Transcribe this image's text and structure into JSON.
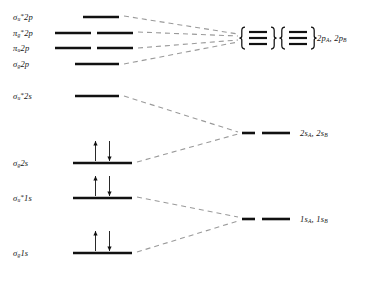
{
  "chart_data": {
    "type": "diagram",
    "xlabel": "",
    "ylabel": "",
    "grid": false,
    "legend": false,
    "mo_levels": [
      {
        "id": "sigma-u-star-2p",
        "label_parts": {
          "symbol": "σ",
          "sub": "u",
          "star": "*",
          "shell": "2p"
        },
        "label_text": "σu*2p",
        "y": 17,
        "degeneracy": 1,
        "electrons": 0,
        "segments": [
          {
            "x1": 83,
            "x2": 119
          }
        ]
      },
      {
        "id": "pi-g-star-2p",
        "label_parts": {
          "symbol": "π",
          "sub": "g",
          "star": "*",
          "shell": "2p"
        },
        "label_text": "πg*2p",
        "y": 33,
        "degeneracy": 2,
        "electrons": 0,
        "segments": [
          {
            "x1": 55,
            "x2": 91
          },
          {
            "x1": 97,
            "x2": 133
          }
        ]
      },
      {
        "id": "pi-u-2p",
        "label_parts": {
          "symbol": "π",
          "sub": "u",
          "star": "",
          "shell": "2p"
        },
        "label_text": "πu2p",
        "y": 48,
        "degeneracy": 2,
        "electrons": 0,
        "segments": [
          {
            "x1": 55,
            "x2": 91
          },
          {
            "x1": 97,
            "x2": 133
          }
        ]
      },
      {
        "id": "sigma-g-2p",
        "label_parts": {
          "symbol": "σ",
          "sub": "g",
          "star": "",
          "shell": "2p"
        },
        "label_text": "σg2p",
        "y": 64,
        "degeneracy": 1,
        "electrons": 0,
        "segments": [
          {
            "x1": 75,
            "x2": 119
          }
        ]
      },
      {
        "id": "sigma-u-star-2s",
        "label_parts": {
          "symbol": "σ",
          "sub": "u",
          "star": "*",
          "shell": "2s"
        },
        "label_text": "σu*2s",
        "y": 96,
        "degeneracy": 1,
        "electrons": 0,
        "segments": [
          {
            "x1": 75,
            "x2": 119
          }
        ]
      },
      {
        "id": "sigma-g-2s",
        "label_parts": {
          "symbol": "σ",
          "sub": "g",
          "star": "",
          "shell": "2s"
        },
        "label_text": "σg2s",
        "y": 163,
        "degeneracy": 1,
        "electrons": 2,
        "segments": [
          {
            "x1": 73,
            "x2": 132
          }
        ]
      },
      {
        "id": "sigma-u-star-1s",
        "label_parts": {
          "symbol": "σ",
          "sub": "u",
          "star": "*",
          "shell": "1s"
        },
        "label_text": "σu*1s",
        "y": 198,
        "degeneracy": 1,
        "electrons": 2,
        "segments": [
          {
            "x1": 73,
            "x2": 132
          }
        ]
      },
      {
        "id": "sigma-g-1s",
        "label_parts": {
          "symbol": "σ",
          "sub": "g",
          "star": "",
          "shell": "1s"
        },
        "label_text": "σg1s",
        "y": 253,
        "degeneracy": 1,
        "electrons": 2,
        "segments": [
          {
            "x1": 73,
            "x2": 132
          }
        ]
      }
    ],
    "ao_levels": [
      {
        "id": "ao-2p",
        "label_text": "2pA, 2pB",
        "label_parts": [
          {
            "shell": "2p",
            "sub": "A"
          },
          {
            "shell": "2p",
            "sub": "B"
          }
        ],
        "y": 38,
        "braced": true,
        "brace_groups": 2,
        "lines_per_group": 3
      },
      {
        "id": "ao-2s",
        "label_text": "2sA, 2sB",
        "label_parts": [
          {
            "shell": "2s",
            "sub": "A"
          },
          {
            "shell": "2s",
            "sub": "B"
          }
        ],
        "y": 133,
        "braced": false,
        "segments": [
          {
            "x1": 242,
            "x2": 255
          },
          {
            "x1": 262,
            "x2": 290
          }
        ]
      },
      {
        "id": "ao-1s",
        "label_text": "1sA, 1sB",
        "label_parts": [
          {
            "shell": "1s",
            "sub": "A"
          },
          {
            "shell": "1s",
            "sub": "B"
          }
        ],
        "y": 219,
        "braced": false,
        "segments": [
          {
            "x1": 242,
            "x2": 255
          },
          {
            "x1": 262,
            "x2": 290
          }
        ]
      }
    ],
    "correlation_lines": [
      {
        "from": "sigma-u-star-2p",
        "to": "ao-2p",
        "x1": 124,
        "y1": 16,
        "x2": 238,
        "y2": 34
      },
      {
        "from": "pi-g-star-2p",
        "to": "ao-2p",
        "x1": 138,
        "y1": 32,
        "x2": 238,
        "y2": 36
      },
      {
        "from": "pi-u-2p",
        "to": "ao-2p",
        "x1": 138,
        "y1": 48,
        "x2": 238,
        "y2": 40
      },
      {
        "from": "sigma-g-2p",
        "to": "ao-2p",
        "x1": 124,
        "y1": 64,
        "x2": 238,
        "y2": 42
      },
      {
        "from": "sigma-u-star-2s",
        "to": "ao-2s",
        "x1": 124,
        "y1": 96,
        "x2": 238,
        "y2": 132
      },
      {
        "from": "sigma-g-2s",
        "to": "ao-2s",
        "x1": 137,
        "y1": 162,
        "x2": 238,
        "y2": 134
      },
      {
        "from": "sigma-u-star-1s",
        "to": "ao-1s",
        "x1": 137,
        "y1": 197,
        "x2": 238,
        "y2": 217
      },
      {
        "from": "sigma-g-1s",
        "to": "ao-1s",
        "x1": 137,
        "y1": 252,
        "x2": 238,
        "y2": 221
      }
    ],
    "electron_arrows": {
      "up_glyph": "↑",
      "down_glyph": "↓",
      "note": "Each filled level carries one spin-up and one spin-down electron"
    },
    "colors": {
      "level_line": "#111111",
      "correlation_line": "#9a9a9a",
      "text": "#141414",
      "background": "#ffffff"
    }
  }
}
